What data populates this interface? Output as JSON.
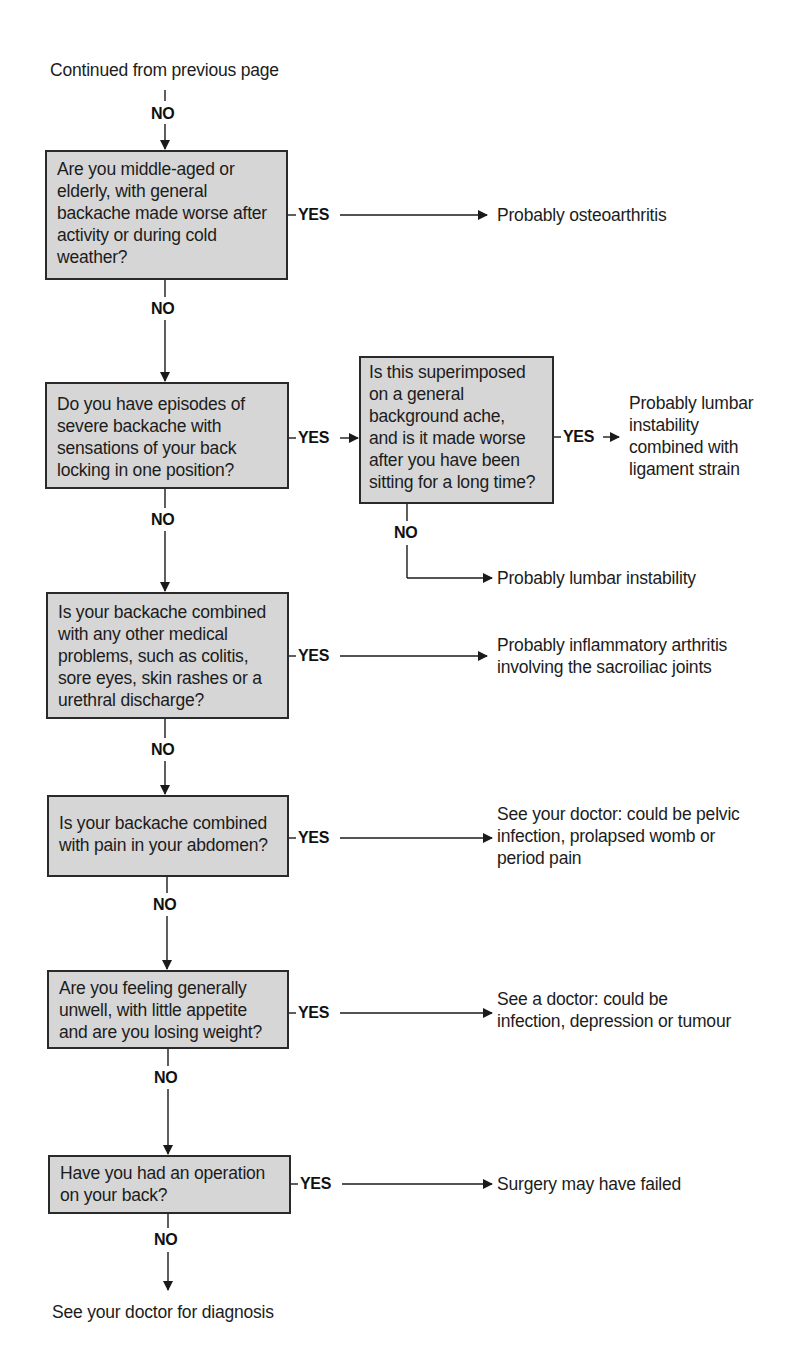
{
  "start": {
    "label": "Continued from previous page"
  },
  "branch_labels": {
    "yes": "YES",
    "no": "NO"
  },
  "questions": [
    {
      "id": "q1",
      "lines": [
        "Are you middle-aged or",
        "elderly, with general",
        "backache made worse after",
        "activity or during cold",
        "weather?"
      ],
      "yes_result": {
        "lines": [
          "Probably osteoarthritis"
        ]
      }
    },
    {
      "id": "q2",
      "lines": [
        "Do you have episodes of",
        "severe backache with",
        "sensations of your back",
        "locking in one position?"
      ],
      "yes_followup": {
        "id": "q2a",
        "lines": [
          "Is this superimposed",
          "on a general",
          "background ache,",
          "and is it made worse",
          "after you have been",
          "sitting for a long time?"
        ],
        "yes_result": {
          "lines": [
            "Probably lumbar",
            "instability",
            "combined with",
            "ligament strain"
          ]
        },
        "no_result": {
          "lines": [
            "Probably lumbar instability"
          ]
        }
      }
    },
    {
      "id": "q3",
      "lines": [
        "Is your backache combined",
        "with any other medical",
        "problems, such as colitis,",
        "sore eyes, skin rashes or a",
        "urethral discharge?"
      ],
      "yes_result": {
        "lines": [
          "Probably inflammatory arthritis",
          "involving the sacroiliac joints"
        ]
      }
    },
    {
      "id": "q4",
      "lines": [
        "Is your backache combined",
        "with pain in your abdomen?"
      ],
      "yes_result": {
        "lines": [
          "See your doctor: could be pelvic",
          "infection, prolapsed womb or",
          "period pain"
        ]
      }
    },
    {
      "id": "q5",
      "lines": [
        "Are you feeling generally",
        "unwell, with little appetite",
        "and are you losing weight?"
      ],
      "yes_result": {
        "lines": [
          "See a doctor: could be",
          "infection, depression or tumour"
        ]
      }
    },
    {
      "id": "q6",
      "lines": [
        "Have you had an operation",
        "on your back?"
      ],
      "yes_result": {
        "lines": [
          "Surgery may have failed"
        ]
      }
    }
  ],
  "end": {
    "label": "See your doctor for diagnosis"
  },
  "colors": {
    "box_fill": "#d6d6d6",
    "box_border": "#2a2a2a",
    "line": "#1a1a1a",
    "text": "#1c1c1c"
  }
}
